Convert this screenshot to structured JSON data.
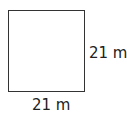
{
  "diagram": {
    "shape": "square",
    "side_right_label": "21 m",
    "side_bottom_label": "21 m",
    "stroke_color": "#333333"
  }
}
